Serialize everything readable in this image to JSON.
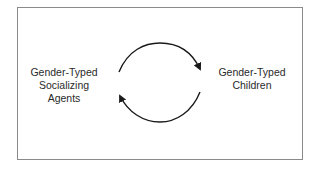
{
  "diagram": {
    "type": "cycle",
    "nodes": [
      {
        "id": "agents",
        "lines": [
          "Gender-Typed",
          "Socializing",
          "Agents"
        ]
      },
      {
        "id": "children",
        "lines": [
          "Gender-Typed",
          "Children"
        ]
      }
    ],
    "edges": [
      {
        "from": "agents",
        "to": "children",
        "shape": "arc-top"
      },
      {
        "from": "children",
        "to": "agents",
        "shape": "arc-bottom"
      }
    ],
    "colors": {
      "border": "#8a8a8a",
      "arrow": "#1a1a1a",
      "text": "#2a2a2a"
    }
  }
}
